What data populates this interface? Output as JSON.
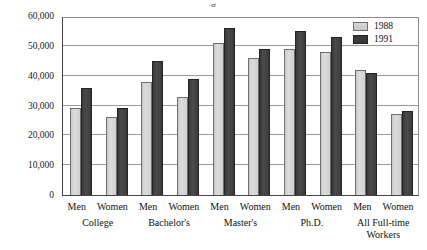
{
  "title_sliver": "g",
  "legend": {
    "position": "top-right",
    "entries": [
      {
        "label": "1988",
        "color": "#d2d2d2",
        "swatch": "legend-swatch-1988"
      },
      {
        "label": "1991",
        "color": "#3b3b3b",
        "swatch": "legend-swatch-1991"
      }
    ]
  },
  "yaxis": {
    "ticks": [
      "60,000",
      "50,000",
      "40,000",
      "30,000",
      "20,000",
      "10,000",
      "0"
    ]
  },
  "chart_data": {
    "type": "bar",
    "title": "",
    "subtitle": "",
    "xlabel": "",
    "ylabel": "",
    "ylim": [
      0,
      60000
    ],
    "ytick_values": [
      0,
      10000,
      20000,
      30000,
      40000,
      50000,
      60000
    ],
    "ytick_labels": [
      "0",
      "10,000",
      "20,000",
      "30,000",
      "40,000",
      "50,000",
      "60,000"
    ],
    "grid": true,
    "grid_axis": "y",
    "legend_position": "top-right",
    "groups": [
      "College",
      "Bachelor's",
      "Master's",
      "Ph.D.",
      "All Full-time Workers"
    ],
    "subgroups": [
      "Men",
      "Women"
    ],
    "categories": [
      "College Men",
      "College Women",
      "Bachelor's Men",
      "Bachelor's Women",
      "Master's Men",
      "Master's Women",
      "Ph.D. Men",
      "Ph.D. Women",
      "All Full-time Workers Men",
      "All Full-time Workers Women"
    ],
    "series": [
      {
        "name": "1988",
        "color": "#d2d2d2",
        "values": [
          29000,
          26000,
          38000,
          33000,
          51000,
          46000,
          49000,
          48000,
          42000,
          27000
        ]
      },
      {
        "name": "1991",
        "color": "#3b3b3b",
        "values": [
          36000,
          29000,
          45000,
          39000,
          56000,
          49000,
          55000,
          53000,
          41000,
          28000
        ]
      }
    ]
  },
  "xaxis": {
    "groups": [
      {
        "name": "College",
        "subs": [
          "Men",
          "Women"
        ]
      },
      {
        "name": "Bachelor's",
        "subs": [
          "Men",
          "Women"
        ]
      },
      {
        "name": "Master's",
        "subs": [
          "Men",
          "Women"
        ]
      },
      {
        "name": "Ph.D.",
        "subs": [
          "Men",
          "Women"
        ]
      },
      {
        "name": "All Full-time\nWorkers",
        "subs": [
          "Men",
          "Women"
        ]
      }
    ]
  }
}
